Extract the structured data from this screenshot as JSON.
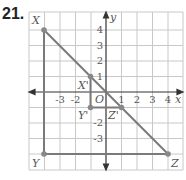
{
  "problem_number": "21.",
  "axes": {
    "x_label": "x",
    "y_label": "y",
    "origin_label": "O"
  },
  "x_ticks": [
    "-3",
    "-2",
    "1",
    "2",
    "3",
    "4"
  ],
  "y_ticks": [
    "4",
    "3",
    "2",
    "1",
    "-2",
    "-3"
  ],
  "points": {
    "X": {
      "label": "X",
      "coord": [
        -4,
        4
      ]
    },
    "Y": {
      "label": "Y",
      "coord": [
        -4,
        -4
      ]
    },
    "Z": {
      "label": "Z",
      "coord": [
        4,
        -4
      ]
    },
    "Xp": {
      "label": "X'",
      "coord": [
        -1,
        1
      ]
    },
    "Yp": {
      "label": "Y'",
      "coord": [
        -1,
        -1
      ]
    },
    "Zp": {
      "label": "Z'",
      "coord": [
        1,
        -1
      ]
    }
  },
  "colors": {
    "grid": "#c8c8c8",
    "line": "#7a7a7a",
    "axis": "#333333",
    "point": "#888888"
  }
}
